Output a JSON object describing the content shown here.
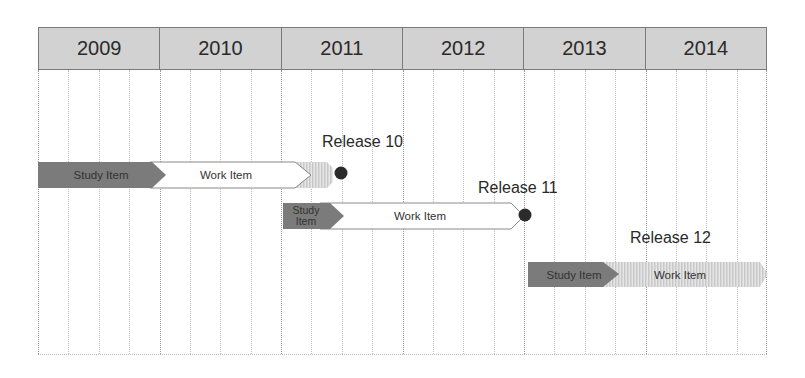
{
  "header": {
    "years": [
      "2009",
      "2010",
      "2011",
      "2012",
      "2013",
      "2014"
    ]
  },
  "grid": {
    "quarters_per_year": 4
  },
  "releases": [
    {
      "name": "Release 10",
      "study_label": "Study Item",
      "work_label": "Work Item"
    },
    {
      "name": "Release 11",
      "study_label": "Study Item",
      "work_label": "Work Item"
    },
    {
      "name": "Release 12",
      "study_label": "Study Item",
      "work_label": "Work Item"
    }
  ],
  "colors": {
    "header_bg": "#d2d2d2",
    "study_item": "#7b7b7b",
    "work_item": "#ffffff",
    "hatched": "#d4d4d4",
    "milestone": "#2b2b2b"
  }
}
